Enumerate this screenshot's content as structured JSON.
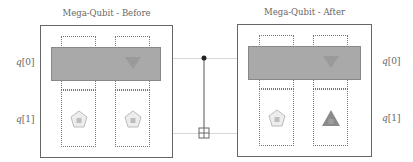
{
  "panels": [
    {
      "title": "Mega-Qubit - Before",
      "qubit_labels": [
        "q",
        "[0]",
        "q",
        "[1]"
      ],
      "lower_shapes": [
        {
          "shape": "pentagon",
          "label": "|0⟩",
          "fill": "#ededed"
        },
        {
          "shape": "pentagon",
          "label": "|0⟩",
          "fill": "#ededed"
        }
      ],
      "bar_color": "#a9a9a9"
    },
    {
      "title": "Mega-Qubit - After",
      "qubit_labels": [
        "q",
        "[0]",
        "q",
        "[1]"
      ],
      "lower_shapes": [
        {
          "shape": "pentagon",
          "label": "|0⟩",
          "fill": "#ededed"
        },
        {
          "shape": "triangle",
          "label": "|1⟩",
          "fill": "#8a8a8a"
        }
      ],
      "bar_color": "#a9a9a9"
    }
  ],
  "gate": {
    "type": "CNOT",
    "control": "q[0]",
    "target": "q[1]"
  },
  "colors": {
    "outline": "#666666",
    "bar": "#a9a9a9",
    "wire": "#d8d8d8"
  }
}
